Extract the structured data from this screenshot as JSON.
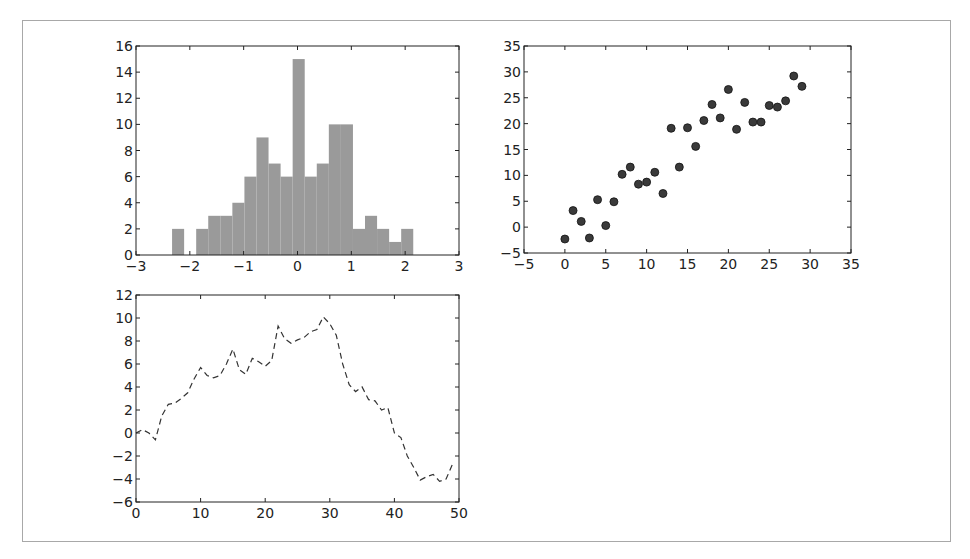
{
  "figure": {
    "frame_color": "#a8a8a8",
    "axes_color": "#222222",
    "bar_color": "#9a9a9a",
    "marker_color": "#3a3a3a",
    "line_color": "#333333"
  },
  "chart_data": [
    {
      "type": "bar",
      "subtype": "histogram",
      "title": "",
      "xlabel": "",
      "ylabel": "",
      "xlim": [
        -3,
        3
      ],
      "ylim": [
        0,
        16
      ],
      "xticks": [
        -3,
        -2,
        -1,
        0,
        1,
        2,
        3
      ],
      "yticks": [
        0,
        2,
        4,
        6,
        8,
        10,
        12,
        14,
        16
      ],
      "bin_start": -2.33,
      "bin_width": 0.224,
      "values": [
        2,
        0,
        2,
        3,
        3,
        4,
        6,
        9,
        7,
        6,
        15,
        6,
        7,
        10,
        10,
        2,
        3,
        2,
        1,
        2
      ],
      "grid": false,
      "box": {
        "left": 136,
        "top": 46,
        "right": 459,
        "bottom": 255
      }
    },
    {
      "type": "scatter",
      "title": "",
      "xlabel": "",
      "ylabel": "",
      "xlim": [
        -5,
        35
      ],
      "ylim": [
        -5,
        35
      ],
      "xticks": [
        -5,
        0,
        5,
        10,
        15,
        20,
        25,
        30,
        35
      ],
      "yticks": [
        -5,
        0,
        5,
        10,
        15,
        20,
        25,
        30,
        35
      ],
      "x": [
        0,
        1,
        2,
        3,
        4,
        5,
        6,
        7,
        8,
        9,
        10,
        11,
        12,
        13,
        14,
        15,
        16,
        17,
        18,
        19,
        20,
        21,
        22,
        23,
        24,
        25,
        26,
        27,
        28,
        29
      ],
      "y": [
        -2.3,
        3.2,
        1.1,
        -2.1,
        5.3,
        0.3,
        4.9,
        10.2,
        11.6,
        8.3,
        8.7,
        10.6,
        6.5,
        19.1,
        11.6,
        19.2,
        15.6,
        20.6,
        23.7,
        21.1,
        26.6,
        18.9,
        24.1,
        20.3,
        20.3,
        23.5,
        23.2,
        24.4,
        29.2,
        27.2
      ],
      "grid": false,
      "box": {
        "left": 524,
        "top": 46,
        "right": 851,
        "bottom": 253
      }
    },
    {
      "type": "line",
      "style": "dashed",
      "title": "",
      "xlabel": "",
      "ylabel": "",
      "xlim": [
        0,
        50
      ],
      "ylim": [
        -6,
        12
      ],
      "xticks": [
        0,
        10,
        20,
        30,
        40,
        50
      ],
      "yticks": [
        -6,
        -4,
        -2,
        0,
        2,
        4,
        6,
        8,
        10,
        12
      ],
      "x": [
        0,
        1,
        2,
        3,
        4,
        5,
        6,
        7,
        8,
        9,
        10,
        11,
        12,
        13,
        14,
        15,
        16,
        17,
        18,
        19,
        20,
        21,
        22,
        23,
        24,
        25,
        26,
        27,
        28,
        29,
        30,
        31,
        32,
        33,
        34,
        35,
        36,
        37,
        38,
        39,
        40,
        41,
        42,
        43,
        44,
        45,
        46,
        47,
        48,
        49
      ],
      "y": [
        0,
        0.3,
        0,
        -0.6,
        1.5,
        2.5,
        2.6,
        3,
        3.5,
        4.7,
        5.7,
        5,
        4.8,
        5,
        6,
        7.3,
        5.5,
        5.1,
        6.5,
        6.2,
        5.8,
        6.3,
        9.3,
        8.2,
        7.8,
        8.1,
        8.3,
        8.8,
        9,
        10.1,
        9.5,
        8.5,
        6,
        4.2,
        3.6,
        4,
        2.9,
        2.8,
        2,
        2.2,
        0,
        -0.4,
        -2,
        -3,
        -4.1,
        -3.8,
        -3.6,
        -4.2,
        -4,
        -2.7
      ],
      "grid": false,
      "box": {
        "left": 136,
        "top": 295,
        "right": 459,
        "bottom": 502
      }
    }
  ]
}
